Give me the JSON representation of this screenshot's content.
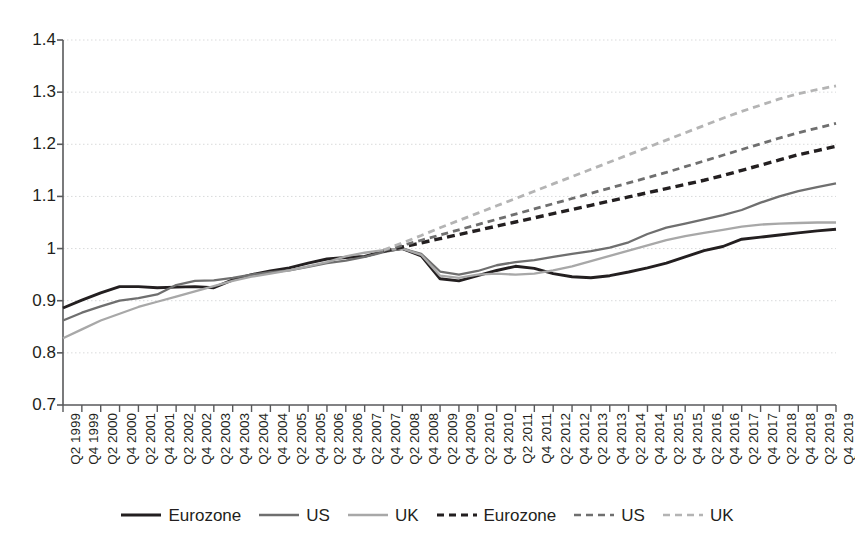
{
  "chart_data": {
    "type": "line",
    "title": "",
    "xlabel": "",
    "ylabel": "",
    "ylim": [
      0.7,
      1.4
    ],
    "ytick_labels": [
      "1.4",
      "1.3",
      "1.2",
      "1.1",
      "1",
      "0.9",
      "0.8",
      "0.7"
    ],
    "ytick_values": [
      1.4,
      1.3,
      1.2,
      1.1,
      1.0,
      0.9,
      0.8,
      0.7
    ],
    "grid": "horizontal-dotted",
    "legend_position": "bottom-center",
    "categories": [
      "Q2 1999",
      "Q4 1999",
      "Q2 2000",
      "Q4 2000",
      "Q2 2001",
      "Q4 2001",
      "Q2 2002",
      "Q4 2002",
      "Q2 2003",
      "Q4 2003",
      "Q2 2004",
      "Q4 2004",
      "Q2 2005",
      "Q4 2005",
      "Q2 2006",
      "Q4 2006",
      "Q2 2007",
      "Q4 2007",
      "Q2 2008",
      "Q4 2008",
      "Q2 2009",
      "Q4 2009",
      "Q2 2010",
      "Q4 2010",
      "Q2 2011",
      "Q4 2011",
      "Q2 2012",
      "Q4 2012",
      "Q2 2013",
      "Q4 2013",
      "Q2 2014",
      "Q4 2014",
      "Q2 2015",
      "Q4 2015",
      "Q2 2016",
      "Q4 2016",
      "Q2 2017",
      "Q4 2017",
      "Q2 2018",
      "Q4 2018",
      "Q2 2019",
      "Q4 2019"
    ],
    "series": [
      {
        "name": "Eurozone",
        "style": "solid",
        "color": "#231f20",
        "values": [
          0.886,
          0.901,
          0.915,
          0.927,
          0.927,
          0.925,
          0.926,
          0.927,
          0.925,
          0.94,
          0.95,
          0.957,
          0.963,
          0.972,
          0.98,
          0.983,
          0.985,
          0.995,
          1.0,
          0.986,
          0.942,
          0.938,
          0.948,
          0.958,
          0.966,
          0.962,
          0.952,
          0.946,
          0.944,
          0.948,
          0.955,
          0.963,
          0.972,
          0.984,
          0.996,
          1.004,
          1.018,
          1.022,
          1.026,
          1.03,
          1.034,
          1.037
        ]
      },
      {
        "name": "US",
        "style": "solid",
        "color": "#6f6f6f",
        "values": [
          0.862,
          0.877,
          0.889,
          0.9,
          0.905,
          0.912,
          0.93,
          0.938,
          0.939,
          0.944,
          0.95,
          0.955,
          0.958,
          0.965,
          0.972,
          0.977,
          0.984,
          0.993,
          1.0,
          0.99,
          0.956,
          0.95,
          0.957,
          0.968,
          0.974,
          0.978,
          0.984,
          0.99,
          0.995,
          1.002,
          1.012,
          1.028,
          1.04,
          1.048,
          1.056,
          1.064,
          1.074,
          1.088,
          1.1,
          1.11,
          1.118,
          1.125
        ]
      },
      {
        "name": "UK",
        "style": "solid",
        "color": "#a8a8a8",
        "values": [
          0.828,
          0.845,
          0.862,
          0.875,
          0.888,
          0.898,
          0.908,
          0.918,
          0.928,
          0.938,
          0.946,
          0.952,
          0.958,
          0.966,
          0.974,
          0.985,
          0.992,
          0.997,
          1.0,
          0.988,
          0.948,
          0.944,
          0.95,
          0.952,
          0.95,
          0.952,
          0.958,
          0.966,
          0.976,
          0.986,
          0.996,
          1.006,
          1.016,
          1.024,
          1.03,
          1.036,
          1.042,
          1.046,
          1.048,
          1.049,
          1.05,
          1.05
        ]
      },
      {
        "name": "Eurozone",
        "style": "dashed",
        "color": "#231f20",
        "trend_from": "Q4 2007",
        "values": [
          null,
          null,
          null,
          null,
          null,
          null,
          null,
          null,
          null,
          null,
          null,
          null,
          null,
          null,
          null,
          null,
          null,
          0.995,
          1.003,
          1.011,
          1.019,
          1.027,
          1.035,
          1.043,
          1.051,
          1.059,
          1.067,
          1.075,
          1.083,
          1.091,
          1.099,
          1.107,
          1.115,
          1.123,
          1.131,
          1.14,
          1.15,
          1.16,
          1.17,
          1.18,
          1.188,
          1.196
        ]
      },
      {
        "name": "US",
        "style": "dashed",
        "color": "#6f6f6f",
        "trend_from": "Q4 2007",
        "values": [
          null,
          null,
          null,
          null,
          null,
          null,
          null,
          null,
          null,
          null,
          null,
          null,
          null,
          null,
          null,
          null,
          null,
          0.996,
          1.006,
          1.016,
          1.026,
          1.036,
          1.046,
          1.056,
          1.066,
          1.076,
          1.086,
          1.096,
          1.106,
          1.116,
          1.126,
          1.136,
          1.146,
          1.157,
          1.168,
          1.179,
          1.19,
          1.201,
          1.212,
          1.222,
          1.231,
          1.24
        ]
      },
      {
        "name": "UK",
        "style": "dashed",
        "color": "#b4b4b4",
        "trend_from": "Q4 2007",
        "values": [
          null,
          null,
          null,
          null,
          null,
          null,
          null,
          null,
          null,
          null,
          null,
          null,
          null,
          null,
          null,
          null,
          null,
          0.997,
          1.011,
          1.025,
          1.04,
          1.054,
          1.068,
          1.082,
          1.096,
          1.11,
          1.124,
          1.138,
          1.152,
          1.166,
          1.18,
          1.194,
          1.208,
          1.222,
          1.236,
          1.25,
          1.263,
          1.275,
          1.287,
          1.297,
          1.305,
          1.312
        ]
      }
    ],
    "legend": [
      {
        "label": "Eurozone",
        "color": "#231f20",
        "style": "solid",
        "width": 3.2
      },
      {
        "label": "US",
        "color": "#6f6f6f",
        "style": "solid",
        "width": 2.6
      },
      {
        "label": "UK",
        "color": "#a8a8a8",
        "style": "solid",
        "width": 2.6
      },
      {
        "label": "Eurozone",
        "color": "#231f20",
        "style": "dashed",
        "width": 3.2
      },
      {
        "label": "US",
        "color": "#6f6f6f",
        "style": "dashed",
        "width": 2.6
      },
      {
        "label": "UK",
        "color": "#b4b4b4",
        "style": "dashed",
        "width": 2.6
      }
    ]
  },
  "axis_colors": {
    "axis_line": "#58595b",
    "grid_line": "#d9dadb",
    "text": "#231f20"
  }
}
